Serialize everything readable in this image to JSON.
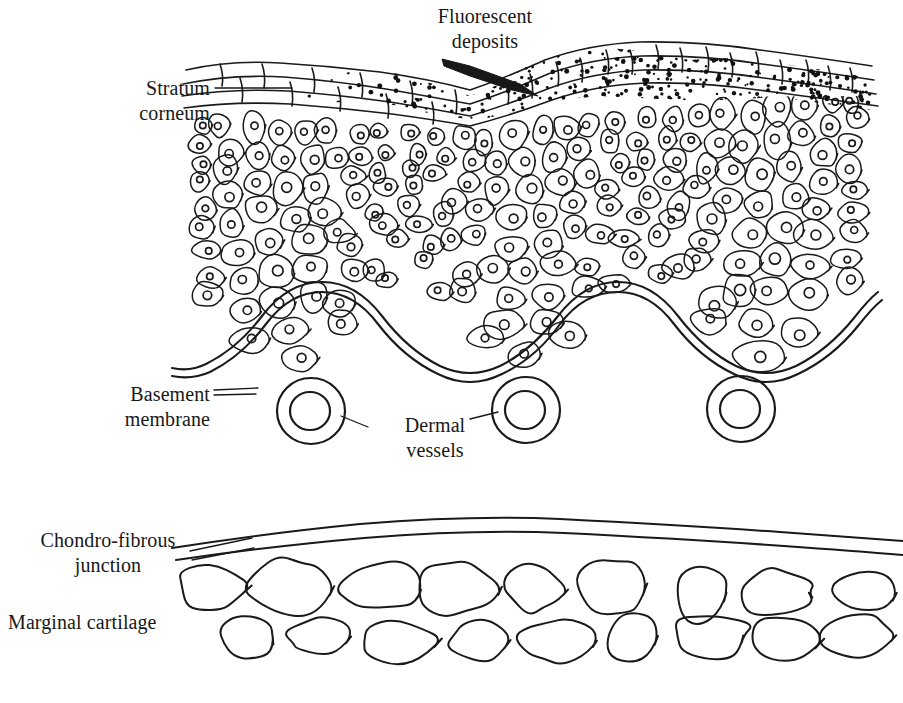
{
  "figure": {
    "kind": "histology-cross-section-diagram",
    "background_color": "#ffffff",
    "ink_color": "#1a1a1a",
    "width": 903,
    "height": 703
  },
  "labels": {
    "fluorescent_deposits": "Fluorescent\ndeposits",
    "stratum_corneum": "Stratum\ncorneum",
    "basement_membrane": "Basement\nmembrane",
    "dermal_vessels": "Dermal\nvessels",
    "chondro_fibrous_junction": "Chondro-fibrous\njunction",
    "marginal_cartilage": "Marginal cartilage",
    "bottom_caption": ""
  },
  "structures": {
    "epidermis": {
      "name": "stratified squamous epidermis",
      "cell_rows": 9,
      "cells_per_row_max": 26,
      "nucleus_shape": "small open circle"
    },
    "stratum_corneum": {
      "name": "stratum corneum",
      "layers": 4,
      "description": "flattened keratinised squames drawn as long thin overlapping lenses"
    },
    "fluorescent_deposits": {
      "name": "fluorescent deposits",
      "render": "dense black stipple",
      "dot_count": 620,
      "span_x": [
        300,
        870
      ],
      "description": "stippled band lying within and above the stratum corneum, thickest at the right"
    },
    "basement_membrane": {
      "name": "basement membrane",
      "render": "double wavy line",
      "waves": 3,
      "amplitude_px": 34
    },
    "dermal_vessels": {
      "name": "dermal vessels",
      "count": 3,
      "render": "concentric annuli",
      "centers": [
        [
          311,
          411
        ],
        [
          526,
          410
        ],
        [
          741,
          409
        ]
      ],
      "outer_radius": 33,
      "inner_radius": 19
    },
    "chondro_fibrous_junction": {
      "name": "chondro-fibrous junction",
      "render": "pair of long gently wavy parallel lines",
      "span_x": [
        170,
        903
      ]
    },
    "marginal_cartilage": {
      "name": "marginal cartilage",
      "render": "two staggered rows of rounded lacunae outlines",
      "upper_row_count": 9,
      "lower_row_count": 9,
      "span_x": [
        175,
        903
      ]
    }
  },
  "leaders": {
    "fluorescent_deposits": "arrow from label down-right into the stippled crest",
    "stratum_corneum": "horizontal rule from label to the squame layer",
    "basement_membrane": "short double rule from label to the membrane",
    "dermal_vessels": "two short diagonal rules to the left and middle vessel",
    "chondro_fibrous_junction": "two short diagonal rules to the paired junction lines"
  }
}
